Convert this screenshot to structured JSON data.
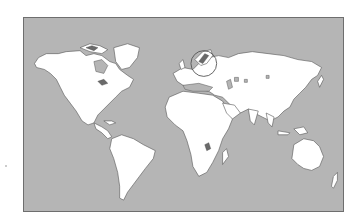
{
  "map": {
    "type": "world-outline-map",
    "ocean_color": "#b5b5b5",
    "land_color": "#ffffff",
    "border_color": "#6e6e6e",
    "highlight": {
      "label": "",
      "region": "Scandinavia (Norway)",
      "shape": "circle",
      "center": [
        204,
        63
      ],
      "radius": 13,
      "stroke_color": "#555555"
    },
    "continents": [
      "North America",
      "Greenland",
      "South America",
      "Europe",
      "Asia",
      "Africa",
      "Australia",
      "New Zealand"
    ]
  }
}
